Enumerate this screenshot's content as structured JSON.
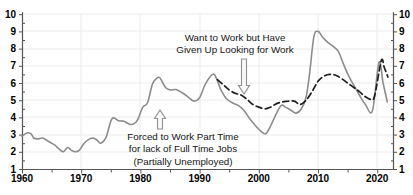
{
  "chart_data": {
    "type": "line",
    "title": "",
    "xlabel": "",
    "ylabel": "",
    "grid": true,
    "legend": "none (labels drawn as in-plot annotations with arrows)",
    "x_axis": {
      "min": 1960,
      "max": 2022.7,
      "major_ticks": [
        1960,
        1970,
        1980,
        1990,
        2000,
        2010,
        2020
      ],
      "tick_labels": [
        "1960",
        "1970",
        "1980",
        "1990",
        "2000",
        "2010",
        "2020"
      ],
      "minor_tick_step": 5
    },
    "y_axis": {
      "min": 1,
      "max": 10,
      "major_ticks": [
        1,
        2,
        3,
        4,
        5,
        6,
        7,
        8,
        9,
        10
      ],
      "minor_tick_step": 0.5,
      "sides": [
        "left",
        "right"
      ]
    },
    "series": [
      {
        "id": "partially-unemployed",
        "name": "Forced to Work Part Time for lack of Full Time Jobs (Partially Unemployed)",
        "line_style": "solid",
        "color": "#8c8c8c",
        "points": [
          [
            1960,
            2.9
          ],
          [
            1960.8,
            3.1
          ],
          [
            1961.5,
            3.05
          ],
          [
            1962,
            2.8
          ],
          [
            1962.7,
            2.75
          ],
          [
            1963.5,
            2.8
          ],
          [
            1964.5,
            2.6
          ],
          [
            1965.5,
            2.4
          ],
          [
            1966.3,
            2.15
          ],
          [
            1967,
            2.0
          ],
          [
            1967.7,
            2.25
          ],
          [
            1968.3,
            2.1
          ],
          [
            1969,
            2.0
          ],
          [
            1969.7,
            2.1
          ],
          [
            1970.5,
            2.5
          ],
          [
            1971.3,
            2.72
          ],
          [
            1972,
            2.8
          ],
          [
            1972.6,
            2.7
          ],
          [
            1973.3,
            2.5
          ],
          [
            1974.2,
            2.85
          ],
          [
            1975.2,
            3.92
          ],
          [
            1976.3,
            3.8
          ],
          [
            1977.2,
            3.78
          ],
          [
            1978.2,
            3.6
          ],
          [
            1979,
            3.65
          ],
          [
            1979.6,
            3.9
          ],
          [
            1980.4,
            4.6
          ],
          [
            1981.2,
            4.85
          ],
          [
            1982,
            5.9
          ],
          [
            1982.7,
            6.25
          ],
          [
            1983.3,
            6.3
          ],
          [
            1984.2,
            5.75
          ],
          [
            1985,
            5.6
          ],
          [
            1986,
            5.62
          ],
          [
            1987,
            5.45
          ],
          [
            1988,
            5.2
          ],
          [
            1989,
            4.95
          ],
          [
            1990,
            5.15
          ],
          [
            1991,
            5.95
          ],
          [
            1992.2,
            6.5
          ],
          [
            1992.8,
            6.3
          ],
          [
            1993.6,
            5.6
          ],
          [
            1994.5,
            5.1
          ],
          [
            1995.5,
            4.85
          ],
          [
            1996.5,
            4.7
          ],
          [
            1997.5,
            4.4
          ],
          [
            1998.5,
            3.9
          ],
          [
            1999.5,
            3.5
          ],
          [
            2000.5,
            3.15
          ],
          [
            2001.2,
            3.05
          ],
          [
            2002,
            3.5
          ],
          [
            2003,
            4.25
          ],
          [
            2003.8,
            4.7
          ],
          [
            2004.5,
            4.6
          ],
          [
            2005.5,
            4.4
          ],
          [
            2006.3,
            4.25
          ],
          [
            2007.2,
            4.5
          ],
          [
            2008,
            5.2
          ],
          [
            2008.6,
            6.6
          ],
          [
            2009.3,
            8.7
          ],
          [
            2010,
            9.0
          ],
          [
            2010.7,
            8.7
          ],
          [
            2011.5,
            8.4
          ],
          [
            2012.3,
            8.2
          ],
          [
            2013,
            8.0
          ],
          [
            2013.5,
            7.8
          ],
          [
            2014.3,
            7.1
          ],
          [
            2015.2,
            6.4
          ],
          [
            2016,
            5.9
          ],
          [
            2017,
            5.3
          ],
          [
            2018,
            4.75
          ],
          [
            2019.2,
            4.4
          ],
          [
            2020.3,
            7.2
          ],
          [
            2021,
            6.0
          ],
          [
            2021.7,
            4.9
          ]
        ]
      },
      {
        "id": "given-up-looking",
        "name": "Want to Work but Have Given Up Looking for Work",
        "line_style": "dashed",
        "color": "#1d1d1d",
        "points": [
          [
            1993,
            6.2
          ],
          [
            1994,
            5.9
          ],
          [
            1995,
            5.6
          ],
          [
            1996,
            5.4
          ],
          [
            1997,
            5.3
          ],
          [
            1998,
            5.05
          ],
          [
            1999,
            4.75
          ],
          [
            2000,
            4.6
          ],
          [
            2001,
            4.5
          ],
          [
            2002,
            4.6
          ],
          [
            2003,
            4.8
          ],
          [
            2004,
            4.9
          ],
          [
            2005,
            4.95
          ],
          [
            2006,
            4.95
          ],
          [
            2007,
            4.75
          ],
          [
            2008,
            5.0
          ],
          [
            2009,
            5.5
          ],
          [
            2010,
            6.1
          ],
          [
            2011,
            6.4
          ],
          [
            2012,
            6.5
          ],
          [
            2013,
            6.45
          ],
          [
            2014,
            6.25
          ],
          [
            2015,
            6.0
          ],
          [
            2016,
            5.75
          ],
          [
            2017,
            5.5
          ],
          [
            2018,
            5.2
          ],
          [
            2019,
            5.05
          ],
          [
            2019.6,
            5.3
          ],
          [
            2020.7,
            7.3
          ],
          [
            2021.2,
            6.9
          ],
          [
            2021.8,
            6.35
          ]
        ]
      }
    ],
    "annotations": [
      {
        "id": "given-up-looking",
        "lines": [
          "Want to Work but Have",
          "Given Up Looking for Work"
        ],
        "text_x": 235,
        "text_y": 32,
        "arrow": {
          "direction": "down",
          "cx": 244,
          "from_y": 59,
          "to_y": 94
        }
      },
      {
        "id": "partially-unemployed",
        "lines": [
          "Forced to Work Part Time",
          "for lack of Full Time Jobs",
          "(Partially Unemployed)"
        ],
        "text_x": 183,
        "text_y": 131,
        "arrow": {
          "direction": "up",
          "cx": 160,
          "from_y": 129,
          "to_y": 110
        }
      }
    ],
    "colors": {
      "background": "#ffffff",
      "grid": "#ebebeb",
      "axis": "#555555",
      "tick_label": "#000000",
      "annotation_text": "#161616",
      "arrow_fill": "#f8f8f8",
      "arrow_stroke": "#8f8f8f"
    }
  }
}
